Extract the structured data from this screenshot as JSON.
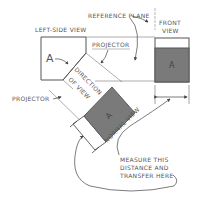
{
  "diagram": {
    "labels": {
      "reference_plane": "REFERENCE PLANE",
      "left_side_view": "LEFT-SIDE VIEW",
      "front_view_line1": "FRONT",
      "front_view_line2": "VIEW",
      "projector_top": "PROJECTOR",
      "projector_left": "PROJECTOR",
      "direction_line1": "DIRECTION",
      "direction_line2": "OF VIEW",
      "normal_view": "NORMAL VIEW",
      "measure_line1": "MEASURE THIS",
      "measure_line2": "DISTANCE AND",
      "measure_line3": "TRANSFER HERE",
      "face_left": "A",
      "face_front": "A",
      "face_normal": "A"
    },
    "colors": {
      "line": "#555555",
      "shaded_face": "#7a7a7a",
      "background": "#ffffff"
    }
  }
}
